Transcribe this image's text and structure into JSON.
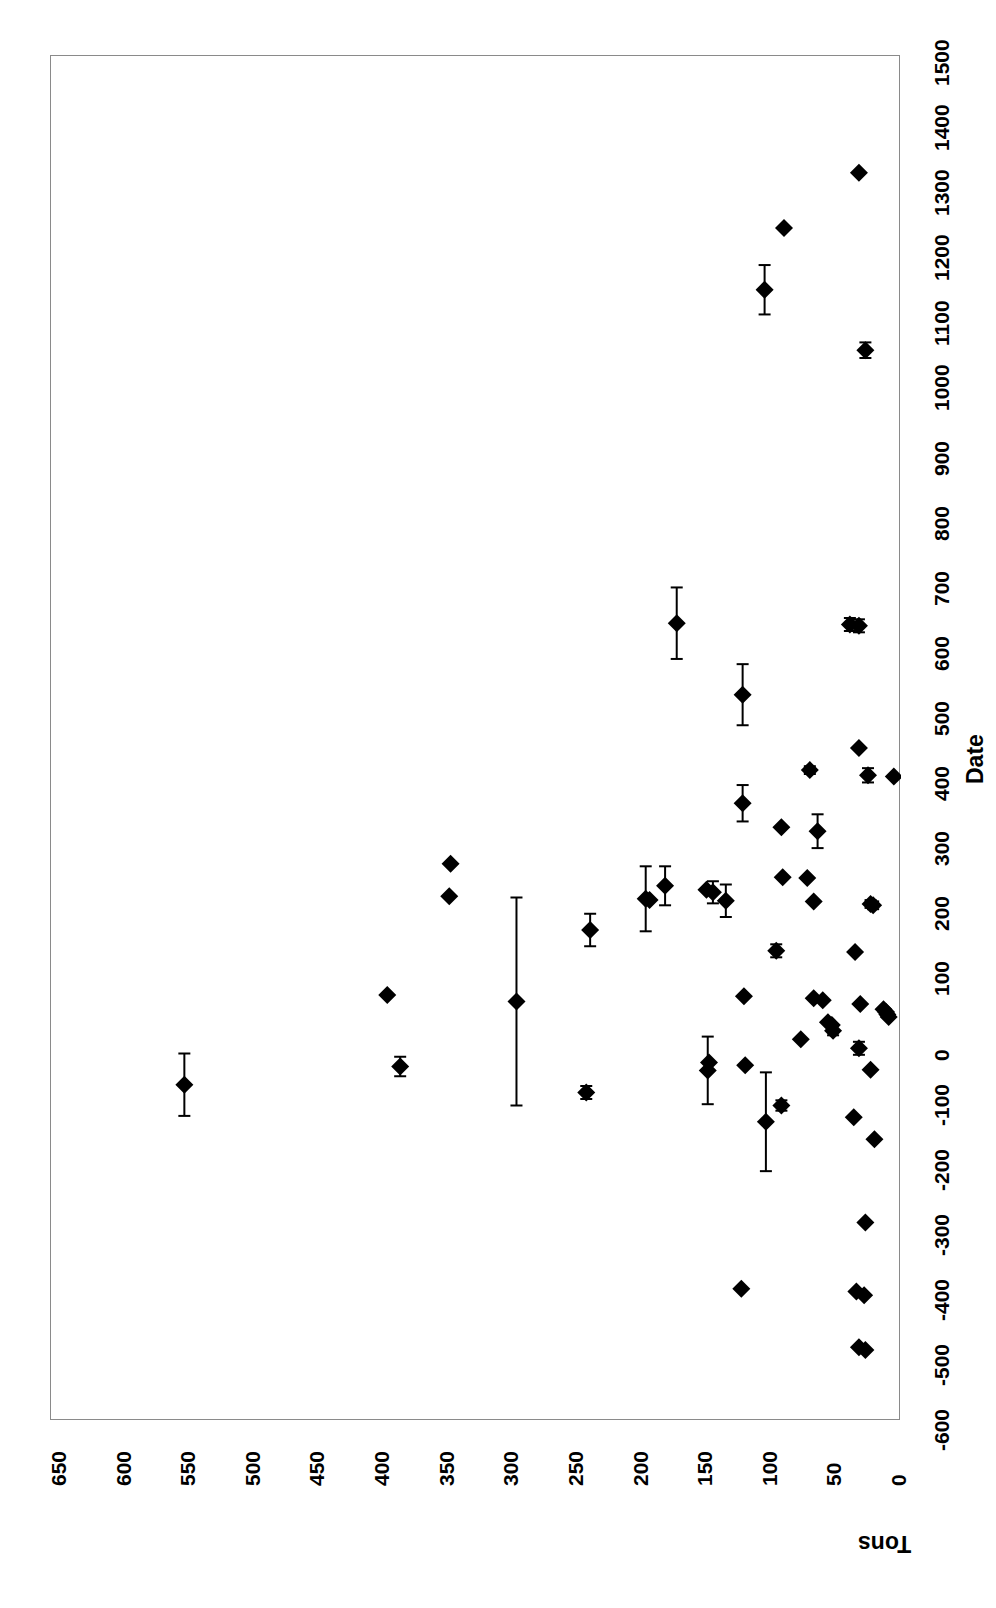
{
  "chart_data": {
    "type": "scatter",
    "title": "",
    "orientation": "rotated-90-ccw",
    "xlabel": "Tons",
    "ylabel": "Date",
    "grid": false,
    "legend": null,
    "xlim": [
      0,
      650
    ],
    "ylim": [
      -600,
      1500
    ],
    "x_axis_reversed": true,
    "x_ticks": [
      650,
      600,
      550,
      500,
      450,
      400,
      350,
      300,
      250,
      200,
      150,
      100,
      50,
      0
    ],
    "y_ticks": [
      -600,
      -500,
      -400,
      -300,
      -200,
      -100,
      0,
      100,
      200,
      300,
      400,
      500,
      600,
      700,
      800,
      900,
      1000,
      1100,
      1200,
      1300,
      1400,
      1500
    ],
    "marker": "filled-diamond",
    "marker_color": "#000000",
    "error_bar_axis": "date",
    "points": [
      {
        "date": 1325,
        "tons": 31,
        "date_err": 0
      },
      {
        "date": 1240,
        "tons": 89,
        "date_err": 0
      },
      {
        "date": 1145,
        "tons": 104,
        "date_err": 38
      },
      {
        "date": 1052,
        "tons": 26,
        "date_err": 12
      },
      {
        "date": 632,
        "tons": 172,
        "date_err": 55
      },
      {
        "date": 630,
        "tons": 38,
        "date_err": 10
      },
      {
        "date": 628,
        "tons": 31,
        "date_err": 10
      },
      {
        "date": 522,
        "tons": 121,
        "date_err": 47
      },
      {
        "date": 440,
        "tons": 31,
        "date_err": 0
      },
      {
        "date": 406,
        "tons": 69,
        "date_err": 6
      },
      {
        "date": 398,
        "tons": 24,
        "date_err": 11
      },
      {
        "date": 396,
        "tons": 4,
        "date_err": 0
      },
      {
        "date": 355,
        "tons": 121,
        "date_err": 28
      },
      {
        "date": 318,
        "tons": 91,
        "date_err": 0
      },
      {
        "date": 312,
        "tons": 63,
        "date_err": 26
      },
      {
        "date": 262,
        "tons": 347,
        "date_err": 0
      },
      {
        "date": 241,
        "tons": 90,
        "date_err": 0
      },
      {
        "date": 240,
        "tons": 71,
        "date_err": 0
      },
      {
        "date": 228,
        "tons": 181,
        "date_err": 30
      },
      {
        "date": 222,
        "tons": 149,
        "date_err": 0
      },
      {
        "date": 218,
        "tons": 144,
        "date_err": 17
      },
      {
        "date": 212,
        "tons": 348,
        "date_err": 0
      },
      {
        "date": 208,
        "tons": 196,
        "date_err": 50
      },
      {
        "date": 206,
        "tons": 193,
        "date_err": 0
      },
      {
        "date": 205,
        "tons": 134,
        "date_err": 25
      },
      {
        "date": 204,
        "tons": 66,
        "date_err": 0
      },
      {
        "date": 200,
        "tons": 22,
        "date_err": 6
      },
      {
        "date": 198,
        "tons": 20,
        "date_err": 6
      },
      {
        "date": 160,
        "tons": 239,
        "date_err": 25
      },
      {
        "date": 128,
        "tons": 95,
        "date_err": 10
      },
      {
        "date": 126,
        "tons": 34,
        "date_err": 0
      },
      {
        "date": 60,
        "tons": 396,
        "date_err": 0
      },
      {
        "date": 58,
        "tons": 120,
        "date_err": 0
      },
      {
        "date": 55,
        "tons": 66,
        "date_err": 0
      },
      {
        "date": 52,
        "tons": 59,
        "date_err": 0
      },
      {
        "date": 50,
        "tons": 296,
        "date_err": 160
      },
      {
        "date": 46,
        "tons": 30,
        "date_err": 0
      },
      {
        "date": 38,
        "tons": 12,
        "date_err": 0
      },
      {
        "date": 34,
        "tons": 10,
        "date_err": 0
      },
      {
        "date": 30,
        "tons": 9,
        "date_err": 0
      },
      {
        "date": 26,
        "tons": 8,
        "date_err": 0
      },
      {
        "date": 18,
        "tons": 55,
        "date_err": 0
      },
      {
        "date": 14,
        "tons": 52,
        "date_err": 0
      },
      {
        "date": 5,
        "tons": 51,
        "date_err": 7
      },
      {
        "date": -8,
        "tons": 76,
        "date_err": 0
      },
      {
        "date": -22,
        "tons": 31,
        "date_err": 10
      },
      {
        "date": -44,
        "tons": 147,
        "date_err": 0
      },
      {
        "date": -48,
        "tons": 119,
        "date_err": 0
      },
      {
        "date": -50,
        "tons": 386,
        "date_err": 15
      },
      {
        "date": -55,
        "tons": 22,
        "date_err": 0
      },
      {
        "date": -56,
        "tons": 148,
        "date_err": 52
      },
      {
        "date": -78,
        "tons": 553,
        "date_err": 48
      },
      {
        "date": -90,
        "tons": 242,
        "date_err": 10
      },
      {
        "date": -110,
        "tons": 91,
        "date_err": 8
      },
      {
        "date": -128,
        "tons": 35,
        "date_err": 0
      },
      {
        "date": -135,
        "tons": 103,
        "date_err": 76
      },
      {
        "date": -162,
        "tons": 19,
        "date_err": 0
      },
      {
        "date": -290,
        "tons": 26,
        "date_err": 0
      },
      {
        "date": -392,
        "tons": 122,
        "date_err": 0
      },
      {
        "date": -396,
        "tons": 33,
        "date_err": 0
      },
      {
        "date": -402,
        "tons": 27,
        "date_err": 0
      },
      {
        "date": -482,
        "tons": 31,
        "date_err": 0
      },
      {
        "date": -486,
        "tons": 26,
        "date_err": 0
      }
    ]
  },
  "axes": {
    "date_label": "Date",
    "tons_label": "Tons"
  }
}
